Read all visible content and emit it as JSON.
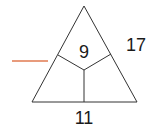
{
  "diagram": {
    "type": "triangle-number-puzzle",
    "top_value": "9",
    "right_value": "17",
    "bottom_value": "11",
    "missing_label": "",
    "blank_line_color": "#e07a50",
    "stroke_color": "#333333"
  }
}
